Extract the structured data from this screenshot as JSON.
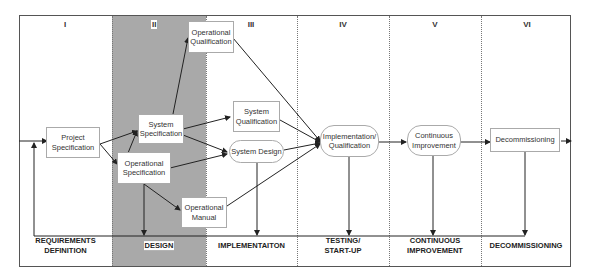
{
  "diagram": {
    "phases": [
      {
        "numeral": "I",
        "label": "REQUIREMENTS DEFINITION",
        "line1": "REQUIREMENTS",
        "line2": "DEFINITION"
      },
      {
        "numeral": "II",
        "label": "DESIGN",
        "line1": "DESIGN",
        "line2": ""
      },
      {
        "numeral": "III",
        "label": "IMPLEMENTAITON",
        "line1": "IMPLEMENTAITON",
        "line2": ""
      },
      {
        "numeral": "IV",
        "label": "TESTING/ START-UP",
        "line1": "TESTING/",
        "line2": "START-UP"
      },
      {
        "numeral": "V",
        "label": "CONTINUOUS IMPROVEMENT",
        "line1": "CONTINUOUS",
        "line2": "IMPROVEMENT"
      },
      {
        "numeral": "VI",
        "label": "DECOMMISSIONING",
        "line1": "DECOMMISSIONING",
        "line2": ""
      }
    ],
    "nodes": {
      "project_spec": {
        "line1": "Project",
        "line2": "Specification"
      },
      "system_spec": {
        "line1": "System",
        "line2": "Specification"
      },
      "operational_spec": {
        "line1": "Operational",
        "line2": "Specification"
      },
      "operational_qual": {
        "line1": "Operational",
        "line2": "Qualification"
      },
      "system_qual": {
        "line1": "System",
        "line2": "Qualification"
      },
      "system_design": {
        "line1": "System Design",
        "line2": ""
      },
      "operational_manual": {
        "line1": "Operational",
        "line2": "Manual"
      },
      "impl_qual": {
        "line1": "Implementation/",
        "line2": "Qualification"
      },
      "continuous_improvement": {
        "line1": "Continuous",
        "line2": "Improvement"
      },
      "decommissioning": {
        "line1": "Decommissioning",
        "line2": ""
      }
    },
    "colors": {
      "shaded_column": "#a9a9a9",
      "frame": "#555555",
      "arrow": "#222222"
    }
  }
}
